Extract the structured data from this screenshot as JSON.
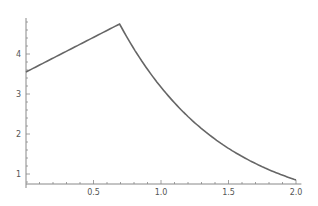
{
  "chart_data": {
    "type": "line",
    "title": "",
    "xlabel": "",
    "ylabel": "",
    "xlim": [
      0,
      2.0
    ],
    "ylim": [
      0.8,
      4.9
    ],
    "grid": false,
    "legend": null,
    "x_ticks": [
      "0.5",
      "1.0",
      "1.5",
      "2.0"
    ],
    "y_ticks": [
      "1",
      "2",
      "3",
      "4"
    ],
    "series": [
      {
        "name": "f(x)",
        "color": "#666666",
        "x": [
          0,
          0.1,
          0.2,
          0.3,
          0.4,
          0.5,
          0.6,
          0.693,
          0.8,
          0.9,
          1.0,
          1.1,
          1.2,
          1.3,
          1.4,
          1.5,
          1.6,
          1.7,
          1.8,
          1.9,
          2.0
        ],
        "y": [
          3.55,
          3.72,
          3.88,
          4.05,
          4.21,
          4.37,
          4.58,
          4.75,
          3.88,
          3.27,
          2.76,
          2.35,
          2.01,
          1.74,
          1.52,
          1.34,
          1.19,
          1.07,
          0.98,
          0.91,
          0.85
        ]
      }
    ]
  }
}
